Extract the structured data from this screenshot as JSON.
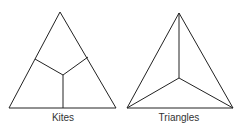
{
  "figures": [
    {
      "label": "Kites",
      "outer_triangle": [
        [
          60,
          12
        ],
        [
          9,
          108
        ],
        [
          116,
          108
        ]
      ],
      "center": [
        63,
        75
      ],
      "edge_midpoints": [
        [
          35,
          59
        ],
        [
          88,
          57
        ],
        [
          63,
          108
        ]
      ],
      "label_pos": [
        63,
        118
      ]
    },
    {
      "label": "Triangles",
      "outer_triangle": [
        [
          179,
          13
        ],
        [
          127,
          108
        ],
        [
          233,
          108
        ]
      ],
      "center": [
        179,
        78
      ],
      "label_pos": [
        179,
        118
      ]
    }
  ],
  "stroke_color": "#222222"
}
